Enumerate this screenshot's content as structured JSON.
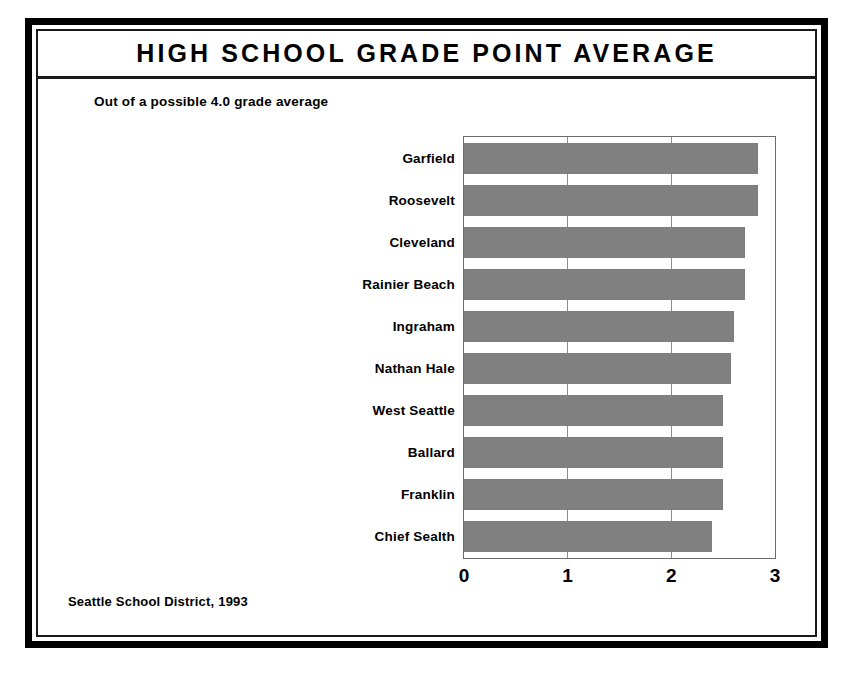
{
  "chart_data": {
    "type": "bar",
    "orientation": "horizontal",
    "title": "HIGH SCHOOL GRADE POINT AVERAGE",
    "subtitle": "Out of a possible 4.0 grade average",
    "source": "Seattle School District, 1993",
    "xlabel": "",
    "ylabel": "",
    "xlim": [
      0,
      3
    ],
    "xticks": [
      "0",
      "1",
      "2",
      "3"
    ],
    "xtick_values": [
      0,
      1,
      2,
      3
    ],
    "grid": true,
    "grid_axis": "x",
    "legend": "none",
    "bar_color": "#808080",
    "frame_color": "#6b6b6b",
    "categories": [
      "Garfield",
      "Roosevelt",
      "Cleveland",
      "Rainier Beach",
      "Ingraham",
      "Nathan Hale",
      "West Seattle",
      "Ballard",
      "Franklin",
      "Chief Sealth"
    ],
    "values": [
      2.84,
      2.84,
      2.71,
      2.71,
      2.6,
      2.58,
      2.5,
      2.5,
      2.5,
      2.39
    ]
  }
}
